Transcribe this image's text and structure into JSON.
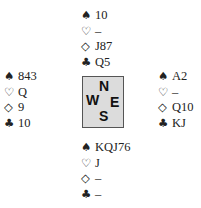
{
  "suit_symbols": {
    "spades": "♠",
    "hearts": "♡",
    "diamonds": "◇",
    "clubs": "♣"
  },
  "compass": {
    "north": "N",
    "west": "W",
    "east": "E",
    "south": "S",
    "background": "#dcdcdc",
    "border": "#555555"
  },
  "hands": {
    "north": {
      "spades": "10",
      "hearts": "–",
      "diamonds": "J87",
      "clubs": "Q5"
    },
    "west": {
      "spades": "843",
      "hearts": "Q",
      "diamonds": "9",
      "clubs": "10"
    },
    "east": {
      "spades": "A2",
      "hearts": "–",
      "diamonds": "Q10",
      "clubs": "KJ"
    },
    "south": {
      "spades": "KQJ76",
      "hearts": "J",
      "diamonds": "–",
      "clubs": "–"
    }
  }
}
